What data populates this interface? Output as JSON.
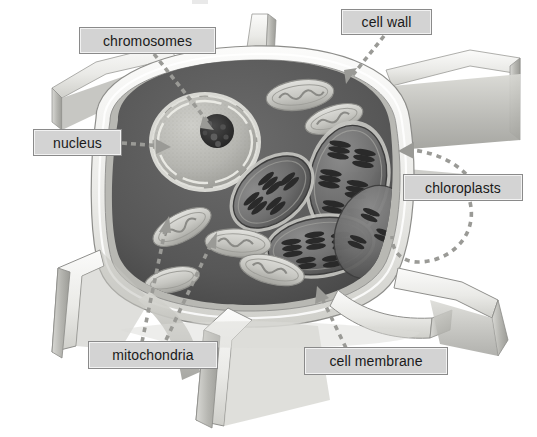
{
  "figure": {
    "style": "grayscale-3d-illustration",
    "canvas": {
      "width": 537,
      "height": 437,
      "background": "#ffffff"
    }
  },
  "labels": [
    {
      "id": "chromosomes",
      "text": "chromosomes",
      "box": {
        "x": 79,
        "y": 27,
        "w": 137,
        "h": 27
      },
      "connector": {
        "style": "dashed-arrow",
        "from": [
          152,
          54
        ],
        "to": [
          205,
          120
        ]
      }
    },
    {
      "id": "cell_wall",
      "text": "cell wall",
      "box": {
        "x": 341,
        "y": 9,
        "w": 91,
        "h": 26
      },
      "connector": {
        "style": "dashed-arrow",
        "from": [
          381,
          35
        ],
        "to": [
          344,
          84
        ]
      }
    },
    {
      "id": "nucleus",
      "text": "nucleus",
      "box": {
        "x": 33,
        "y": 129,
        "w": 89,
        "h": 27
      },
      "connector": {
        "style": "dashed-arrow",
        "from": [
          122,
          143
        ],
        "to": [
          168,
          147
        ]
      }
    },
    {
      "id": "chloroplasts",
      "text": "chloroplasts",
      "box": {
        "x": 403,
        "y": 174,
        "w": 120,
        "h": 27
      },
      "connector": {
        "style": "dashed-arc-arrow",
        "from": [
          420,
          201
        ],
        "to": [
          395,
          148
        ]
      }
    },
    {
      "id": "mitochondria",
      "text": "mitochondria",
      "box": {
        "x": 88,
        "y": 341,
        "w": 130,
        "h": 28
      },
      "connector": {
        "style": "dashed-arrow-double",
        "from": [
          145,
          341
        ],
        "to": [
          170,
          218
        ]
      }
    },
    {
      "id": "cell_membrane",
      "text": "cell membrane",
      "box": {
        "x": 304,
        "y": 347,
        "w": 144,
        "h": 28
      },
      "connector": {
        "style": "dashed-arrow",
        "from": [
          352,
          347
        ],
        "to": [
          322,
          288
        ]
      }
    }
  ],
  "structures": {
    "cell_wall": {
      "name": "cell wall",
      "fill": "#e9e9e7",
      "edge": "#9a9a98"
    },
    "cytoplasm": {
      "name": "cytoplasm",
      "fill": "#5e5e5e"
    },
    "nucleus": {
      "name": "nucleus",
      "fill": "#b9b9b5",
      "envelope": "#d8d8d4"
    },
    "nucleolus": {
      "name": "nucleolus / chromosomes",
      "fill": "#3d3d3d"
    },
    "chloroplasts": {
      "name": "chloroplasts",
      "count": 4,
      "fill": "#6d6d6d",
      "grana": "#2e2e2e"
    },
    "mitochondria": {
      "name": "mitochondria",
      "count": 6,
      "fill": "#cfcfcb",
      "cristae": "#8e8e8a"
    }
  },
  "colors": {
    "background": "#ffffff",
    "label_fill": "#d3d3d3",
    "label_border": "#8a8a8a",
    "label_text": "#1a1a1a",
    "connector": "#8f8f8f",
    "wall_light": "#f1f1ef",
    "wall_mid": "#cdcdc9",
    "wall_shadow": "#8f8f8d",
    "cytoplasm_dark": "#585858"
  }
}
